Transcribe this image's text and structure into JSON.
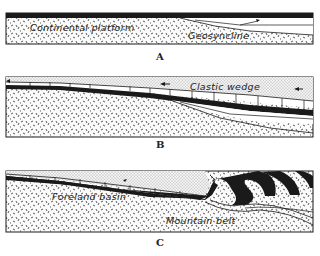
{
  "diagram": {
    "type": "geologic-cross-section-sequence",
    "panels": [
      {
        "caption": "A",
        "labels": [
          "Continental platform",
          "Geosyncline"
        ],
        "arrows": 1
      },
      {
        "caption": "B",
        "labels": [
          "Clastic wedge"
        ],
        "arrows": 3
      },
      {
        "caption": "C",
        "labels": [
          "Foreland basin",
          "Mountain belt"
        ],
        "arrows": 2
      }
    ],
    "colors": {
      "ink": "#1a1a1a",
      "paper": "#ffffff",
      "stipple_bg": "#ececec"
    }
  }
}
